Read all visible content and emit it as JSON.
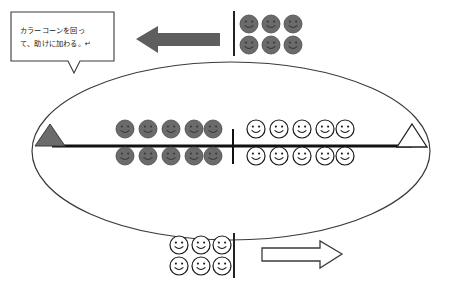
{
  "canvas": {
    "width": 449,
    "height": 288,
    "background": "#ffffff"
  },
  "callout": {
    "name": "instruction-callout",
    "lines": [
      "カラーコーンを回っ",
      "て、助けに加わる。↵"
    ],
    "full_text": "カラーコーンを回って、助けに加わる。",
    "border_color": "#3a3a3a",
    "fill_color": "#ffffff"
  },
  "field": {
    "name": "oval-field",
    "shape": "ellipse",
    "center_x": 231,
    "center_y": 151,
    "radius_x": 199,
    "radius_y": 89,
    "stroke_color": "#3a3a3a",
    "fill_color": "#ffffff"
  },
  "center_line": {
    "name": "center-lane-line",
    "x1": 52,
    "x2": 412,
    "y": 146,
    "color": "#111111",
    "thickness": 3
  },
  "center_tick": {
    "name": "center-tick-mark",
    "x": 233,
    "y1": 129,
    "y2": 164,
    "color": "#111111",
    "thickness": 2
  },
  "cones": [
    {
      "name": "cone-left",
      "side": "left",
      "x": 50,
      "y": 146,
      "width": 30,
      "height": 40,
      "fill": "#6b6b6b",
      "stroke": "#3a3a3a",
      "label": "color-cone-dark"
    },
    {
      "name": "cone-right",
      "side": "right",
      "x": 412,
      "y": 146,
      "width": 30,
      "height": 40,
      "fill": "#ffffff",
      "stroke": "#222222",
      "label": "color-cone-white"
    }
  ],
  "arrows": [
    {
      "name": "arrow-left-top",
      "direction": "left",
      "x": 136,
      "y": 39,
      "length": 84,
      "thickness": 15,
      "head": 22,
      "fill": "#5e5e5e",
      "stroke": "none"
    },
    {
      "name": "arrow-right-bottom",
      "direction": "right",
      "x": 262,
      "y": 254,
      "length": 80,
      "thickness": 15,
      "head": 22,
      "fill": "#ffffff",
      "stroke": "#3a3a3a"
    }
  ],
  "start_lines": [
    {
      "name": "start-line-top",
      "x": 234,
      "y1": 10,
      "y2": 55,
      "color": "#222222",
      "thickness": 2
    },
    {
      "name": "start-line-bottom",
      "x": 234,
      "y1": 232,
      "y2": 278,
      "color": "#222222",
      "thickness": 2
    }
  ],
  "player_groups": [
    {
      "name": "group-top-right-dark",
      "style": "dark",
      "fill": "#6b6b6b",
      "stroke": "#4a4a4a",
      "face_color": "#3a3a3a",
      "radius": 9,
      "rows": [
        {
          "y": 24,
          "xs": [
            249,
            271,
            293
          ]
        },
        {
          "y": 45,
          "xs": [
            249,
            271,
            293
          ]
        }
      ],
      "count": 6
    },
    {
      "name": "group-center-left-dark",
      "style": "dark",
      "fill": "#6b6b6b",
      "stroke": "#4a4a4a",
      "face_color": "#3a3a3a",
      "radius": 9,
      "rows": [
        {
          "y": 129,
          "xs": [
            125,
            148,
            171,
            194,
            213
          ]
        },
        {
          "y": 156,
          "xs": [
            125,
            148,
            171,
            194,
            213
          ]
        }
      ],
      "count": 10
    },
    {
      "name": "group-center-right-white",
      "style": "white",
      "fill": "#ffffff",
      "stroke": "#1a1a1a",
      "face_color": "#1a1a1a",
      "radius": 9,
      "rows": [
        {
          "y": 129,
          "xs": [
            256,
            279,
            302,
            325,
            345
          ]
        },
        {
          "y": 156,
          "xs": [
            256,
            279,
            302,
            325,
            345
          ]
        }
      ],
      "count": 10
    },
    {
      "name": "group-bottom-white",
      "style": "white",
      "fill": "#ffffff",
      "stroke": "#1a1a1a",
      "face_color": "#1a1a1a",
      "radius": 9,
      "rows": [
        {
          "y": 245,
          "xs": [
            179,
            201,
            222
          ]
        },
        {
          "y": 266,
          "xs": [
            179,
            201,
            222
          ]
        }
      ],
      "count": 6
    }
  ],
  "totals": {
    "dark_players": 16,
    "white_players": 16
  }
}
